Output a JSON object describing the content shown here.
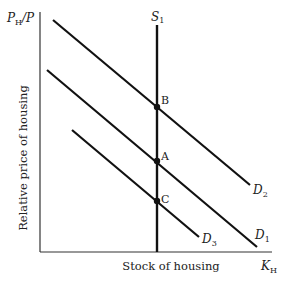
{
  "diagram": {
    "y_axis_label": "P",
    "y_axis_label_sub": "H",
    "y_axis_label_tail": "/P",
    "y_axis_title": "Relative price of housing",
    "x_axis_title": "Stock of housing",
    "x_axis_label": "K",
    "x_axis_label_sub": "H",
    "supply_curve": {
      "label": "S",
      "sub": "1"
    },
    "demand_curves": [
      {
        "label": "D",
        "sub": "2"
      },
      {
        "label": "D",
        "sub": "1"
      },
      {
        "label": "D",
        "sub": "3"
      }
    ],
    "points": [
      {
        "label": "B",
        "on": "D2 ∩ S1"
      },
      {
        "label": "A",
        "on": "D1 ∩ S1"
      },
      {
        "label": "C",
        "on": "D3 ∩ S1"
      }
    ],
    "line_color": "#111111"
  }
}
